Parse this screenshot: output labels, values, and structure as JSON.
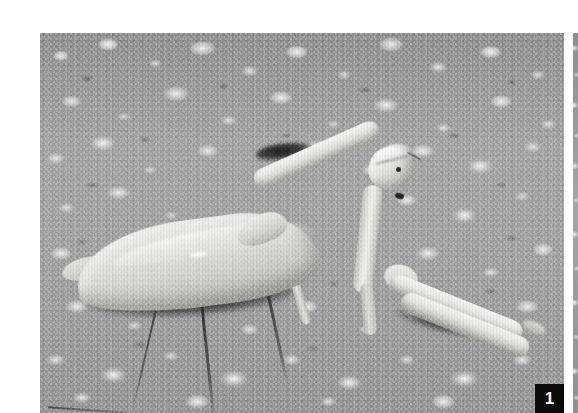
{
  "plate": {
    "kind": "scientific-figure-plate",
    "palette": {
      "page_background": "#ffffff",
      "photo_midtone": "#9d9d9d",
      "photo_highlight": "#f2f2f2",
      "photo_shadow": "#1e1e1e",
      "label_chip_background": "#0b0b0b",
      "label_chip_text": "#ffffff"
    },
    "figures": [
      {
        "number": "1",
        "alt": "Black-and-white photograph of a praying mantis standing in profile on coarse gravel, facing right with raptorial forelegs extended toward the lower right.",
        "subject": "praying mantis",
        "view": "lateral profile, facing right",
        "substrate": "coarse gravel / asphalt",
        "rendering": "grayscale halftone photograph",
        "label_position": "bottom-right"
      },
      {
        "number": "",
        "alt": "Narrow vertical sliver of the adjacent photographic plate, showing the same grey gravel substrate.",
        "subject": "adjacent plate edge",
        "view": "cropped sliver",
        "substrate": "coarse gravel / asphalt",
        "rendering": "grayscale halftone photograph",
        "label_position": "none"
      }
    ],
    "anatomy_labels": {
      "head": "head",
      "eye": "compound eye",
      "antenna": "antenna",
      "prothorax": "elongated prothorax",
      "abdomen": "abdomen with folded wings",
      "foreleg": "raptorial foreleg",
      "midleg": "middle leg",
      "hindleg": "hind leg",
      "shadow": "cast shadow",
      "substrate": "gravel substrate"
    }
  }
}
